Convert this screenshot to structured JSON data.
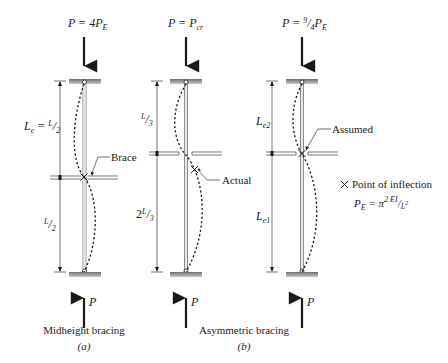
{
  "figure": {
    "columns": [
      {
        "id": "a",
        "load_label": "P = 4P",
        "load_sub": "E",
        "reaction_label": "P",
        "top_length_label": "L",
        "top_length_sub": "e",
        "top_length_eq": " = ",
        "top_length_value_num": "L",
        "top_length_value_den": "2",
        "bottom_length_num": "L",
        "bottom_length_den": "2",
        "callout": "Brace",
        "caption": "Midheight bracing",
        "sublabel": "(a)"
      },
      {
        "id": "b",
        "load_label": "P = P",
        "load_sub": "cr",
        "reaction_label": "P",
        "top_length_num": "L",
        "top_length_den": "3",
        "bottom_length_prefix": "2",
        "bottom_length_num": "L",
        "bottom_length_den": "3",
        "callout": "Actual",
        "caption": "Asymmetric bracing",
        "sublabel": "(b)"
      },
      {
        "id": "c",
        "load_label_prefix": "P = ",
        "load_frac_num": "9",
        "load_frac_den": "4",
        "load_label_suffix": "P",
        "load_sub": "E",
        "reaction_label": "P",
        "top_length_label": "L",
        "top_length_sub": "e2",
        "bottom_length_label": "L",
        "bottom_length_sub": "e1",
        "callout": "Assumed"
      }
    ],
    "legend": {
      "symbol": "✕",
      "symbol_label": "Point of inflection",
      "formula_lhs": "P",
      "formula_lhs_sub": "E",
      "formula_eq": " = π",
      "formula_exp": "2",
      "formula_num": "EI",
      "formula_den": "L",
      "formula_den_exp": "2"
    },
    "colors": {
      "ink": "#1a1a1a",
      "support_gray": "#8c8c8c",
      "column_gray": "#9a9a9a"
    }
  }
}
